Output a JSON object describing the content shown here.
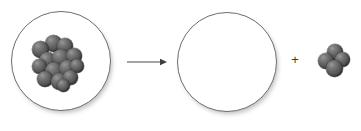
{
  "diagram": {
    "background_color": "#ffffff",
    "parent": {
      "label": "parent-nucleus",
      "circle": {
        "cx": 61,
        "cy": 61,
        "r": 50,
        "stroke_color": "#6d6d6d",
        "fill_color": "#ffffff"
      },
      "nucleon_count": 14,
      "nucleon_color": "#5a5a5a",
      "nucleons": [
        {
          "x": 13,
          "y": 0,
          "d": 17
        },
        {
          "x": 0,
          "y": 6,
          "d": 17
        },
        {
          "x": 25,
          "y": 3,
          "d": 16
        },
        {
          "x": 7,
          "y": 17,
          "d": 17
        },
        {
          "x": 20,
          "y": 14,
          "d": 18
        },
        {
          "x": 34,
          "y": 13,
          "d": 16
        },
        {
          "x": 0,
          "y": 24,
          "d": 15
        },
        {
          "x": 13,
          "y": 27,
          "d": 18
        },
        {
          "x": 27,
          "y": 25,
          "d": 17
        },
        {
          "x": 38,
          "y": 24,
          "d": 14
        },
        {
          "x": 5,
          "y": 36,
          "d": 16
        },
        {
          "x": 19,
          "y": 38,
          "d": 17
        },
        {
          "x": 31,
          "y": 35,
          "d": 15
        },
        {
          "x": 25,
          "y": 44,
          "d": 13
        }
      ]
    },
    "arrow": {
      "label": "yields",
      "color": "#4a4a4a",
      "direction": "right",
      "x1": 127,
      "y1": 62,
      "x2": 166,
      "y2": 62
    },
    "daughter": {
      "label": "daughter-nucleus",
      "circle": {
        "cx": 227,
        "cy": 62,
        "r": 50,
        "stroke_color": "#6d6d6d",
        "fill_color": "#ffffff"
      },
      "nucleon_count": 0
    },
    "plus": {
      "symbol": "+",
      "color": "#3a3a3a"
    },
    "alpha_particle": {
      "label": "alpha-particle",
      "nucleon_count": 4,
      "nucleon_color": "#5a5a5a",
      "nucleons": [
        {
          "x": 9,
          "y": 0,
          "d": 16
        },
        {
          "x": 0,
          "y": 9,
          "d": 16
        },
        {
          "x": 17,
          "y": 8,
          "d": 15
        },
        {
          "x": 8,
          "y": 16,
          "d": 17
        }
      ]
    }
  }
}
